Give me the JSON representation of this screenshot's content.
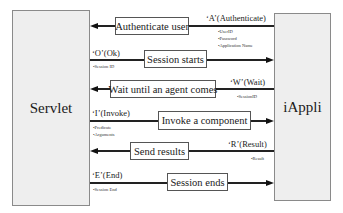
{
  "actors": {
    "left": "Servlet",
    "right": "iAppli"
  },
  "messages": [
    {
      "label": "Authenticate user",
      "direction": "left",
      "code": "‘A’(Authenticate)",
      "params": [
        "•UserID",
        "•Password",
        "•Application Name"
      ]
    },
    {
      "label": "Session starts",
      "direction": "right",
      "code": "‘O’(Ok)",
      "params": [
        "•Session ID"
      ]
    },
    {
      "label": "Wait until an agent comes",
      "direction": "left",
      "code": "‘W’(Wait)",
      "params": [
        "•SessionID"
      ]
    },
    {
      "label": "Invoke a component",
      "direction": "right",
      "code": "‘I’(Invoke)",
      "params": [
        "•Predicate",
        "•Arguments"
      ]
    },
    {
      "label": "Send results",
      "direction": "left",
      "code": "‘R’(Result)",
      "params": [
        "•Result"
      ]
    },
    {
      "label": "Session ends",
      "direction": "right",
      "code": "‘E’(End)",
      "params": [
        "•Session End"
      ]
    }
  ]
}
